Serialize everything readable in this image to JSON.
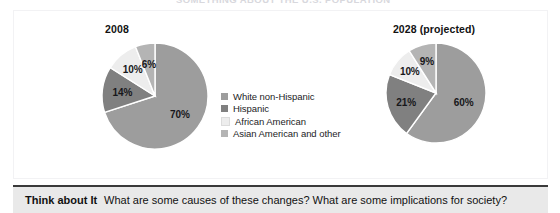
{
  "headline_partial": "SOMETHING ABOUT THE U.S. POPULATION",
  "panel": {
    "background": "#ffffff"
  },
  "legend": {
    "items": [
      {
        "label": "White non-Hispanic",
        "color": "#9d9d9d"
      },
      {
        "label": "Hispanic",
        "color": "#808080"
      },
      {
        "label": "African American",
        "color": "#ededed"
      },
      {
        "label": "Asian American and other",
        "color": "#b4b4b4"
      }
    ]
  },
  "footer": {
    "label": "Think about It",
    "question": "What are some causes of these changes? What are some implications for society?",
    "background": "#e9e9e9",
    "rule_color": "#3a3a3a"
  },
  "chart_data": [
    {
      "type": "pie",
      "title": "2008",
      "categories": [
        "White non-Hispanic",
        "Hispanic",
        "African American",
        "Asian American and other"
      ],
      "values": [
        70,
        14,
        10,
        6
      ],
      "labels": [
        "70%",
        "14%",
        "10%",
        "6%"
      ],
      "colors": [
        "#9d9d9d",
        "#808080",
        "#ededed",
        "#b4b4b4"
      ],
      "units": "percent",
      "legend_position": "right",
      "grid": false
    },
    {
      "type": "pie",
      "title": "2028 (projected)",
      "categories": [
        "White non-Hispanic",
        "Hispanic",
        "African American",
        "Asian American and other"
      ],
      "values": [
        60,
        21,
        10,
        9
      ],
      "labels": [
        "60%",
        "21%",
        "10%",
        "9%"
      ],
      "colors": [
        "#9d9d9d",
        "#808080",
        "#ededed",
        "#b4b4b4"
      ],
      "units": "percent",
      "legend_position": "shared",
      "grid": false
    }
  ]
}
